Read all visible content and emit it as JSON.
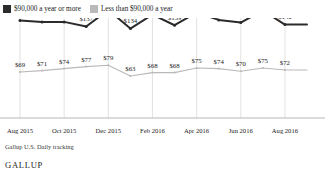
{
  "legend": {
    "items": [
      {
        "label": "$90,000 a year or more",
        "color": "#2b2b2b",
        "swatch_name": "legend-swatch-high-income"
      },
      {
        "label": "Less than $90,000 a year",
        "color": "#b9b9b9",
        "swatch_name": "legend-swatch-low-income"
      }
    ]
  },
  "footer": {
    "source": "Gallup U.S. Daily tracking",
    "brand": "GALLUP"
  },
  "chart_data": {
    "type": "line",
    "title": "",
    "subtitle": "",
    "xlabel": "",
    "ylabel": "",
    "grid": "vertical",
    "legend_position": "top-left",
    "ylim": [
      0,
      200
    ],
    "x": [
      "Aug 2015",
      "Sep 2015",
      "Oct 2015",
      "Nov 2015",
      "Dec 2015",
      "Jan 2016",
      "Feb 2016",
      "Mar 2016",
      "Apr 2016",
      "May 2016",
      "Jun 2016",
      "Jul 2016",
      "Aug 2016",
      "Sep 2016"
    ],
    "tick_labels": [
      "Aug 2015",
      "Oct 2015",
      "Dec 2015",
      "Feb 2016",
      "Apr 2016",
      "Jun 2016",
      "Aug 2016"
    ],
    "tick_indices": [
      0,
      2,
      4,
      6,
      8,
      10,
      12
    ],
    "series": [
      {
        "name": "$90,000 a year or more",
        "color": "#2b2b2b",
        "values": [
          146,
          144,
          144,
          137,
          162,
          134,
          155,
          139,
          158,
          147,
          143,
          161,
          140,
          140
        ],
        "point_labels": [
          "$146",
          "$144",
          "$144",
          "$137",
          "$162",
          "$134",
          "$155",
          "$139",
          "$158",
          "$147",
          "$143",
          "$161",
          "$140",
          ""
        ]
      },
      {
        "name": "Less than $90,000 a year",
        "color": "#b9b9b9",
        "values": [
          69,
          71,
          74,
          77,
          79,
          63,
          68,
          68,
          75,
          74,
          70,
          75,
          72,
          72
        ],
        "point_labels": [
          "$69",
          "$71",
          "$74",
          "$77",
          "$79",
          "$63",
          "$68",
          "$68",
          "$75",
          "$74",
          "$70",
          "$75",
          "$72",
          ""
        ]
      }
    ]
  }
}
